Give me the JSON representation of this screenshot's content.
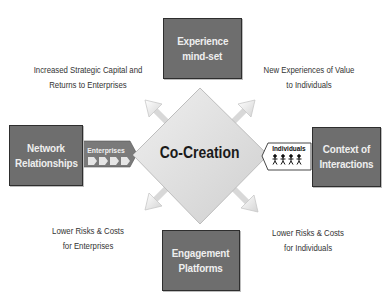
{
  "diagram": {
    "center": {
      "label": "Co-Creation"
    },
    "boxes": {
      "top": {
        "line1": "Experience",
        "line2": "mind-set"
      },
      "left": {
        "line1": "Network",
        "line2": "Relationships"
      },
      "right": {
        "line1": "Context of",
        "line2": "Interactions"
      },
      "bottom": {
        "line1": "Engagement",
        "line2": "Platforms"
      }
    },
    "connectors": {
      "left": {
        "label": "Enterprises",
        "icon": "chevron-arrows-icon"
      },
      "right": {
        "label": "Individuals",
        "icon": "people-figures-icon"
      }
    },
    "outcomes": {
      "top_left": {
        "line1": "Increased Strategic Capital and",
        "line2": "Returns to Enterprises"
      },
      "top_right": {
        "line1": "New Experiences of Value",
        "line2": "to Individuals"
      },
      "bottom_left": {
        "line1": "Lower Risks & Costs",
        "line2": "for Enterprises"
      },
      "bottom_right": {
        "line1": "Lower Risks & Costs",
        "line2": "for Individuals"
      }
    },
    "colors": {
      "box_fill": "#6e6e6e",
      "box_border": "#2e2e2e",
      "diamond_fill": "#dcdcdc",
      "text_dark": "#333333"
    }
  }
}
